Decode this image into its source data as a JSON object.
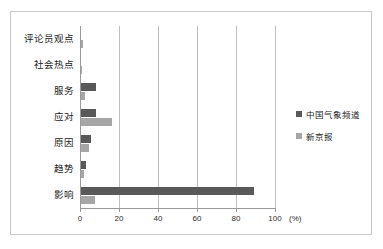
{
  "chart_data": {
    "type": "bar",
    "orientation": "horizontal",
    "title": "",
    "xlabel": "(%)",
    "ylabel": "",
    "xlim": [
      0,
      100
    ],
    "grid": true,
    "legend_position": "right",
    "categories": [
      "评论员观点",
      "社会热点",
      "服务",
      "应对",
      "原因",
      "趋势",
      "影响"
    ],
    "xticks": [
      "0",
      "20",
      "40",
      "60",
      "80",
      "100"
    ],
    "xtick_values": [
      0,
      20,
      40,
      60,
      80,
      100
    ],
    "series": [
      {
        "name": "中国气象频道",
        "color": "#595959",
        "values": [
          0,
          0,
          7.5,
          7.5,
          5,
          2.5,
          88.5
        ]
      },
      {
        "name": "新京报",
        "color": "#a6a6a6",
        "values": [
          1,
          0.5,
          2,
          16,
          4,
          1.5,
          7
        ]
      }
    ]
  },
  "unit_label": "(%)"
}
